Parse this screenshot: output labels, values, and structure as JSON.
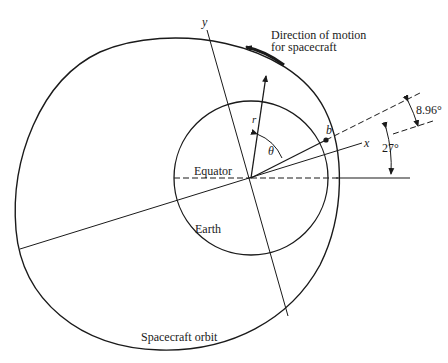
{
  "diagram": {
    "labels": {
      "direction_line1": "Direction of motion",
      "direction_line2": "for spacecraft",
      "y_axis": "y",
      "x_axis": "x",
      "radius": "r",
      "theta": "θ",
      "point_b": "b",
      "equator": "Equator",
      "earth": "Earth",
      "orbit": "Spacecraft orbit",
      "angle_small": "8.96°",
      "angle_large": "27°"
    },
    "colors": {
      "stroke": "#1a1a1a",
      "background": "#ffffff"
    }
  }
}
